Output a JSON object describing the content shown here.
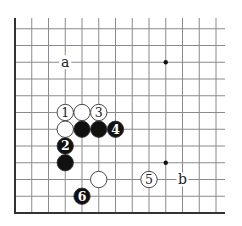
{
  "diagram": {
    "type": "go-board-fragment",
    "visible_edges": [
      "left",
      "bottom"
    ],
    "columns": 13,
    "rows": 12,
    "star_points": [
      {
        "col": 9,
        "row": 9
      },
      {
        "col": 9,
        "row": 3
      }
    ],
    "stones": [
      {
        "color": "white",
        "col": 3,
        "row": 6,
        "label": "1"
      },
      {
        "color": "white",
        "col": 4,
        "row": 6,
        "label": ""
      },
      {
        "color": "white",
        "col": 5,
        "row": 6,
        "label": "3"
      },
      {
        "color": "white",
        "col": 3,
        "row": 5,
        "label": ""
      },
      {
        "color": "black",
        "col": 4,
        "row": 5,
        "label": ""
      },
      {
        "color": "black",
        "col": 5,
        "row": 5,
        "label": ""
      },
      {
        "color": "black",
        "col": 6,
        "row": 5,
        "label": "4"
      },
      {
        "color": "black",
        "col": 3,
        "row": 4,
        "label": "2"
      },
      {
        "color": "black",
        "col": 3,
        "row": 3,
        "label": ""
      },
      {
        "color": "white",
        "col": 5,
        "row": 2,
        "label": ""
      },
      {
        "color": "black",
        "col": 4,
        "row": 1,
        "label": "6"
      },
      {
        "color": "white",
        "col": 8,
        "row": 2,
        "label": "5"
      }
    ],
    "markers": [
      {
        "text": "a",
        "col": 3,
        "row": 9
      },
      {
        "text": "b",
        "col": 10,
        "row": 2
      }
    ],
    "colors": {
      "line": "#8a8a8a",
      "edge": "#333333",
      "black_stone": "#111111",
      "white_stone": "#ffffff",
      "stone_outline": "#333333"
    }
  }
}
